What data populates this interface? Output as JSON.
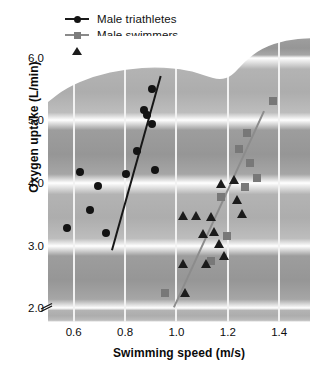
{
  "chart_data": {
    "type": "scatter",
    "title": "",
    "xlabel": "Swimming speed (m/s)",
    "ylabel": "Oxygen uptake (L/min)",
    "xlim": [
      0.5,
      1.52
    ],
    "ylim": [
      1.78,
      6.35
    ],
    "xticks": [
      0.6,
      0.8,
      1.0,
      1.2,
      1.4
    ],
    "xtick_labels": [
      "0.6",
      "0.8",
      "1.0",
      "1.2",
      "1.4"
    ],
    "yticks": [
      2.0,
      3.0,
      4.0,
      5.0,
      6.0
    ],
    "ytick_labels": [
      "2.0",
      "3.0",
      "4.0",
      "5.0",
      "6.0"
    ],
    "grid": "vertical white gridlines at x ticks; alternating shaded horizontal bands between y ticks",
    "y_axis_break": true,
    "legend_position": "above plot, upper left",
    "series": [
      {
        "name": "Male triathletes",
        "marker": "circle",
        "color": "#131313",
        "points": [
          [
            0.575,
            3.28
          ],
          [
            0.625,
            4.18
          ],
          [
            0.665,
            3.57
          ],
          [
            0.695,
            3.95
          ],
          [
            0.725,
            3.2
          ],
          [
            0.805,
            4.15
          ],
          [
            0.845,
            4.52
          ],
          [
            0.875,
            5.17
          ],
          [
            0.885,
            5.08
          ],
          [
            0.905,
            5.51
          ],
          [
            0.905,
            4.95
          ],
          [
            0.915,
            4.21
          ]
        ],
        "fit_line": {
          "x1": 0.745,
          "y1": 2.93,
          "x2": 0.935,
          "y2": 5.72
        }
      },
      {
        "name": "Male swimmers",
        "marker": "square",
        "color": "#787878",
        "points": [
          [
            0.955,
            2.25
          ],
          [
            1.135,
            2.75
          ],
          [
            1.175,
            3.78
          ],
          [
            1.195,
            3.15
          ],
          [
            1.245,
            4.55
          ],
          [
            1.265,
            3.93
          ],
          [
            1.275,
            4.8
          ],
          [
            1.285,
            4.32
          ],
          [
            1.315,
            4.08
          ],
          [
            1.375,
            5.31
          ]
        ],
        "fit_line": {
          "x1": 0.985,
          "y1": 2.02,
          "x2": 1.335,
          "y2": 5.15
        }
      },
      {
        "name": "Female swimmers",
        "marker": "triangle",
        "color": "#1b1b1b",
        "points": [
          [
            1.025,
            3.47
          ],
          [
            1.025,
            2.7
          ],
          [
            1.035,
            2.25
          ],
          [
            1.075,
            3.47
          ],
          [
            1.105,
            3.18
          ],
          [
            1.115,
            2.7
          ],
          [
            1.135,
            3.46
          ],
          [
            1.145,
            3.22
          ],
          [
            1.165,
            3.02
          ],
          [
            1.175,
            3.99
          ],
          [
            1.185,
            2.83
          ],
          [
            1.225,
            4.05
          ],
          [
            1.235,
            3.73
          ],
          [
            1.255,
            3.5
          ]
        ]
      }
    ]
  },
  "legend": {
    "items": [
      {
        "label": "Male triathletes",
        "marker": "circle",
        "line": "black"
      },
      {
        "label": "Male swimmers",
        "marker": "square",
        "line": "gray"
      },
      {
        "label": "Female swimmers",
        "marker": "triangle",
        "line": "none"
      }
    ]
  },
  "colors": {
    "triathlete_marker": "#131313",
    "swimmer_marker": "#787878",
    "female_marker": "#1b1b1b",
    "band_dark": "#969696",
    "band_light": "#adadad",
    "gridline": "#f2f2f2",
    "background": "#ffffff"
  }
}
